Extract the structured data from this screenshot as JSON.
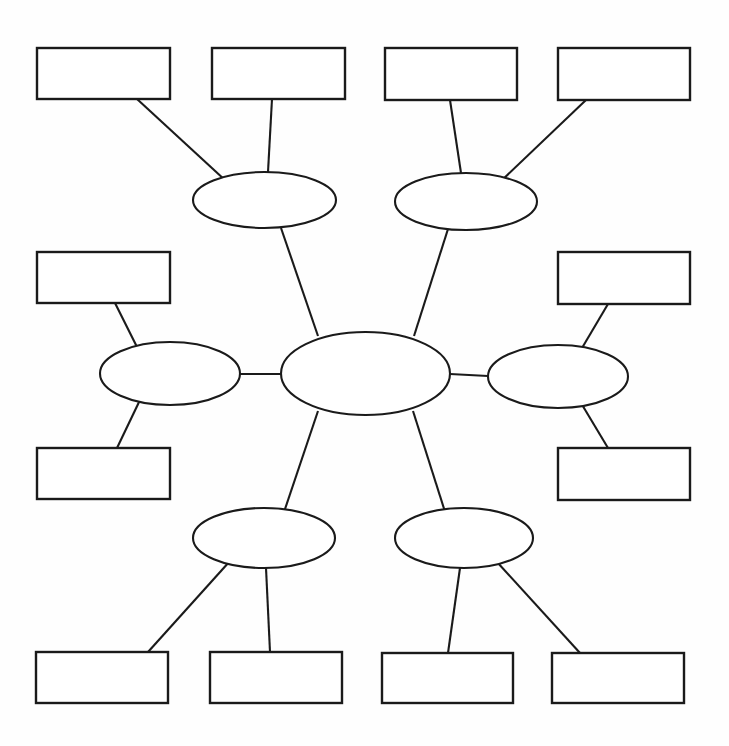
{
  "document": {
    "title": "Concept Map Graphic Organizer",
    "background_color": "#fefefe",
    "stroke_color": "#1a1a1a",
    "shape_fill_color": "#ffffff",
    "width": 729,
    "height": 746
  },
  "diagram": {
    "type": "hub-and-spoke concept map",
    "all_shapes_blank": true,
    "center": {
      "id": "center-ellipse",
      "label": "",
      "cx": 365.5,
      "cy": 373.5,
      "rx": 84.5,
      "ry": 41.5
    },
    "ellipses": [
      {
        "id": "ellipse-top-left",
        "label": "",
        "cx": 264.5,
        "cy": 200.0,
        "rx": 71.5,
        "ry": 28.0
      },
      {
        "id": "ellipse-top-right",
        "label": "",
        "cx": 466.0,
        "cy": 201.5,
        "rx": 71.0,
        "ry": 28.5
      },
      {
        "id": "ellipse-mid-left",
        "label": "",
        "cx": 170.0,
        "cy": 373.5,
        "rx": 70.0,
        "ry": 31.5
      },
      {
        "id": "ellipse-mid-right",
        "label": "",
        "cx": 558.0,
        "cy": 376.5,
        "rx": 70.0,
        "ry": 31.5
      },
      {
        "id": "ellipse-bottom-left",
        "label": "",
        "cx": 264.0,
        "cy": 538.0,
        "rx": 71.0,
        "ry": 30.0
      },
      {
        "id": "ellipse-bottom-right",
        "label": "",
        "cx": 464.0,
        "cy": 538.0,
        "rx": 69.0,
        "ry": 30.0
      }
    ],
    "boxes": [
      {
        "id": "box-top-1",
        "label": "",
        "x": 37,
        "y": 48,
        "w": 133,
        "h": 51
      },
      {
        "id": "box-top-2",
        "label": "",
        "x": 212,
        "y": 48,
        "w": 133,
        "h": 51
      },
      {
        "id": "box-top-3",
        "label": "",
        "x": 385,
        "y": 48,
        "w": 132,
        "h": 52
      },
      {
        "id": "box-top-4",
        "label": "",
        "x": 558,
        "y": 48,
        "w": 132,
        "h": 52
      },
      {
        "id": "box-left-upper",
        "label": "",
        "x": 37,
        "y": 252,
        "w": 133,
        "h": 51
      },
      {
        "id": "box-right-upper",
        "label": "",
        "x": 558,
        "y": 252,
        "w": 132,
        "h": 52
      },
      {
        "id": "box-left-lower",
        "label": "",
        "x": 37,
        "y": 448,
        "w": 133,
        "h": 51
      },
      {
        "id": "box-right-lower",
        "label": "",
        "x": 558,
        "y": 448,
        "w": 132,
        "h": 52
      },
      {
        "id": "box-bottom-1",
        "label": "",
        "x": 36,
        "y": 652,
        "w": 132,
        "h": 51
      },
      {
        "id": "box-bottom-2",
        "label": "",
        "x": 210,
        "y": 652,
        "w": 132,
        "h": 51
      },
      {
        "id": "box-bottom-3",
        "label": "",
        "x": 382,
        "y": 653,
        "w": 131,
        "h": 50
      },
      {
        "id": "box-bottom-4",
        "label": "",
        "x": 552,
        "y": 653,
        "w": 132,
        "h": 50
      }
    ],
    "connectors": [
      {
        "id": "spoke-center-top-left",
        "x1": 318,
        "y1": 336,
        "x2": 281,
        "y2": 228
      },
      {
        "id": "spoke-center-top-right",
        "x1": 414,
        "y1": 336,
        "x2": 448,
        "y2": 229
      },
      {
        "id": "spoke-center-mid-left",
        "x1": 281,
        "y1": 374,
        "x2": 240,
        "y2": 374
      },
      {
        "id": "spoke-center-mid-right",
        "x1": 450,
        "y1": 374,
        "x2": 488,
        "y2": 376
      },
      {
        "id": "spoke-center-bottom-left",
        "x1": 318,
        "y1": 411,
        "x2": 282,
        "y2": 518
      },
      {
        "id": "spoke-center-bottom-right",
        "x1": 413,
        "y1": 411,
        "x2": 447,
        "y2": 518
      },
      {
        "id": "leg-topleft-box1",
        "x1": 226,
        "y1": 181,
        "x2": 137,
        "y2": 99
      },
      {
        "id": "leg-topleft-box2",
        "x1": 268,
        "y1": 172,
        "x2": 272,
        "y2": 99
      },
      {
        "id": "leg-topright-box3",
        "x1": 461,
        "y1": 173,
        "x2": 450,
        "y2": 100
      },
      {
        "id": "leg-topright-box4",
        "x1": 500,
        "y1": 182,
        "x2": 586,
        "y2": 100
      },
      {
        "id": "leg-midleft-boxleftupper",
        "x1": 138,
        "y1": 349,
        "x2": 115,
        "y2": 303
      },
      {
        "id": "leg-midleft-boxleftlower",
        "x1": 140,
        "y1": 400,
        "x2": 117,
        "y2": 448
      },
      {
        "id": "leg-midright-boxrightupper",
        "x1": 582,
        "y1": 348,
        "x2": 608,
        "y2": 304
      },
      {
        "id": "leg-midright-boxrightlower",
        "x1": 581,
        "y1": 403,
        "x2": 608,
        "y2": 448
      },
      {
        "id": "leg-bottomleft-box1",
        "x1": 230,
        "y1": 561,
        "x2": 148,
        "y2": 652
      },
      {
        "id": "leg-bottomleft-box2",
        "x1": 266,
        "y1": 568,
        "x2": 270,
        "y2": 652
      },
      {
        "id": "leg-bottomright-box3",
        "x1": 460,
        "y1": 568,
        "x2": 448,
        "y2": 653
      },
      {
        "id": "leg-bottomright-box4",
        "x1": 497,
        "y1": 562,
        "x2": 580,
        "y2": 653
      }
    ]
  }
}
